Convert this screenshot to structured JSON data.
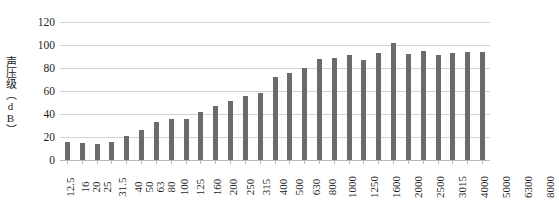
{
  "chart_data": {
    "type": "bar",
    "title": "",
    "subtitle": "",
    "xlabel": "",
    "ylabel": "声压级（dB）",
    "ylim": [
      0,
      120
    ],
    "ytick_step": 20,
    "yticks": [
      "0",
      "20",
      "40",
      "60",
      "80",
      "100",
      "120"
    ],
    "grid": true,
    "legend": false,
    "legend_position": "none",
    "bar_color": "#6b6b6b",
    "gridline_color": "#d4d4d4",
    "categories": [
      "12.5",
      "16",
      "20",
      "25",
      "31.5",
      "40",
      "50",
      "63",
      "80",
      "100",
      "125",
      "160",
      "200",
      "250",
      "315",
      "400",
      "500",
      "630",
      "800",
      "1000",
      "1250",
      "1600",
      "2000",
      "2500",
      "3015",
      "4000",
      "5000",
      "6300",
      "8000"
    ],
    "values": [
      16,
      15,
      14,
      16,
      21,
      26,
      33,
      36,
      36,
      42,
      47,
      51,
      56,
      58,
      72,
      76,
      80,
      88,
      89,
      91,
      87,
      93,
      102,
      92,
      95,
      91,
      93,
      94,
      94
    ]
  }
}
